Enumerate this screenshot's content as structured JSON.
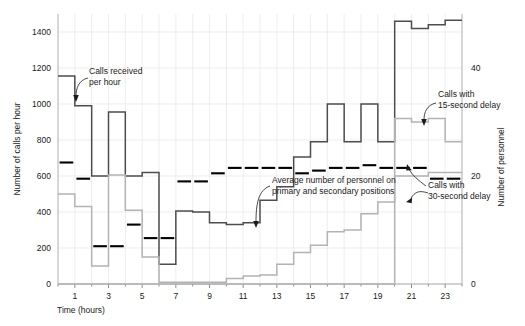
{
  "chart_data": {
    "type": "line",
    "title": "",
    "xlabel": "Time (hours)",
    "ylabel": "Number of calls per hour",
    "y2label": "Number of personnel",
    "xlim": [
      0,
      24
    ],
    "ylim": [
      0,
      1500
    ],
    "y2lim": [
      0,
      50
    ],
    "grid": true,
    "legend_position": "inline-annotations",
    "xticks": [
      1,
      3,
      5,
      7,
      9,
      11,
      13,
      15,
      17,
      19,
      21,
      23
    ],
    "xtick_labels": [
      "1",
      "3",
      "5",
      "7",
      "9",
      "11",
      "13",
      "15",
      "17",
      "19",
      "21",
      "23"
    ],
    "yticks": [
      0,
      200,
      400,
      600,
      800,
      1000,
      1200,
      1400
    ],
    "ytick_labels": [
      "0",
      "200",
      "400",
      "600",
      "800",
      "1000",
      "1200",
      "1400"
    ],
    "y2ticks": [
      0,
      20,
      40
    ],
    "y2tick_labels": [
      "0",
      "20",
      "40"
    ],
    "series": [
      {
        "name": "Calls received per hour",
        "color": "#4d4d4d",
        "style": "step",
        "axis": "left",
        "x": [
          0,
          1,
          2,
          3,
          4,
          5,
          6,
          7,
          8,
          9,
          10,
          11,
          12,
          13,
          14,
          15,
          16,
          17,
          18,
          19,
          20,
          21,
          22,
          23,
          24
        ],
        "values": [
          1155,
          1155,
          990,
          600,
          955,
          600,
          620,
          110,
          405,
          400,
          340,
          330,
          340,
          465,
          540,
          705,
          790,
          1000,
          790,
          1000,
          790,
          1460,
          1420,
          1440,
          1465
        ]
      },
      {
        "name": "Calls with 15-second delay",
        "color": "#b3b3b3",
        "style": "step",
        "axis": "left",
        "x": [
          0,
          1,
          2,
          3,
          4,
          5,
          6,
          7,
          8,
          9,
          10,
          11,
          12,
          13,
          14,
          15,
          16,
          17,
          18,
          19,
          20,
          21,
          22,
          23,
          24
        ],
        "values": [
          500,
          500,
          430,
          100,
          605,
          410,
          150,
          10,
          10,
          10,
          10,
          30,
          45,
          50,
          110,
          175,
          215,
          290,
          300,
          390,
          455,
          920,
          900,
          920,
          790
        ]
      },
      {
        "name": "Calls with 30-second delay",
        "color": "#b3b3b3",
        "style": "step",
        "axis": "left",
        "x": [
          0,
          1,
          2,
          3,
          4,
          5,
          6,
          7,
          8,
          9,
          10,
          11,
          12,
          13,
          14,
          15,
          16,
          17,
          18,
          19,
          20,
          21,
          22,
          23,
          24
        ],
        "values": [
          0,
          0,
          0,
          0,
          0,
          0,
          0,
          0,
          0,
          0,
          0,
          0,
          0,
          0,
          0,
          0,
          0,
          0,
          0,
          0,
          0,
          600,
          600,
          620,
          620
        ]
      },
      {
        "name": "Average number of personnel on primary and secondary positions",
        "color": "#000000",
        "style": "dashes",
        "axis": "right",
        "x": [
          0,
          1,
          2,
          3,
          4,
          5,
          6,
          7,
          8,
          9,
          10,
          11,
          12,
          13,
          14,
          15,
          16,
          17,
          18,
          19,
          20,
          21,
          22,
          23,
          24
        ],
        "values": [
          22.5,
          22.5,
          19.5,
          7,
          7,
          11,
          8.5,
          8.5,
          19,
          19,
          20.5,
          21.5,
          21.5,
          21.5,
          21.5,
          20.5,
          21,
          21.5,
          21.5,
          22,
          21.5,
          21.5,
          21.5,
          19.5,
          19.5
        ]
      }
    ],
    "annotations": [
      {
        "id": "calls-received",
        "text_line1": "Calls received",
        "text_line2": "per hour",
        "target_series": "Calls received per hour"
      },
      {
        "id": "calls-15-second-delay",
        "text_line1": "Calls with",
        "text_line2": "15-second delay",
        "target_series": "Calls with 15-second delay"
      },
      {
        "id": "calls-30-second-delay",
        "text_line1": "Calls with",
        "text_line2": "30-second delay",
        "target_series": "Calls with 30-second delay"
      },
      {
        "id": "average-personnel",
        "text_line1": "Average number of personnel on",
        "text_line2": "primary and secondary positions",
        "target_series": "Average number of personnel on primary and secondary positions"
      }
    ]
  }
}
